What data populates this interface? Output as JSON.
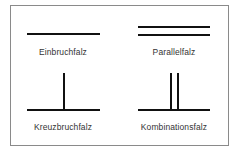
{
  "diagram": {
    "frame_color": "#8a8a8a",
    "line_color": "#111111",
    "items": [
      {
        "label": "Einbruchfalz",
        "type": "single-horizontal"
      },
      {
        "label": "Parallelfalz",
        "type": "double-horizontal"
      },
      {
        "label": "Kreuzbruchfalz",
        "type": "horizontal-with-one-vertical"
      },
      {
        "label": "Kombinationsfalz",
        "type": "horizontal-with-two-verticals"
      }
    ]
  }
}
